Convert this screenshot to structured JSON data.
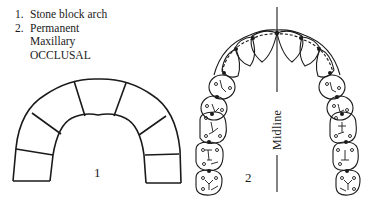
{
  "legend": {
    "items": [
      {
        "num": "1.",
        "text": "Stone block arch"
      },
      {
        "num": "2.",
        "text": "Permanent"
      }
    ],
    "continuation": [
      "Maxillary",
      "OCCLUSAL"
    ]
  },
  "figures": {
    "figure1": {
      "label": "1",
      "description": "Stone block arch"
    },
    "figure2": {
      "label": "2",
      "description": "Permanent maxillary arch, occlusal view"
    },
    "midline_label": "Midline"
  },
  "colors": {
    "ink": "#1a1a1a",
    "background": "#ffffff"
  }
}
